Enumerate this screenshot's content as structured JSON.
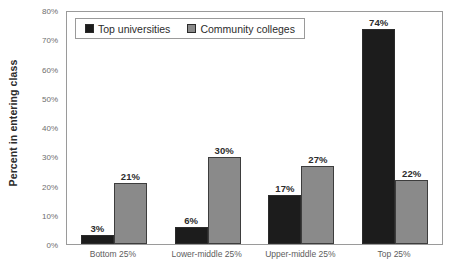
{
  "chart_data": {
    "type": "bar",
    "title": "",
    "xlabel": "",
    "ylabel": "Percent in entering class",
    "categories": [
      "Bottom 25%",
      "Lower-middle 25%",
      "Upper-middle 25%",
      "Top 25%"
    ],
    "series": [
      {
        "name": "Top universities",
        "color": "#1c1c1c",
        "values": [
          3,
          6,
          17,
          74
        ],
        "labels": [
          "3%",
          "6%",
          "17%",
          "74%"
        ]
      },
      {
        "name": "Community colleges",
        "color": "#8a8a8a",
        "values": [
          21,
          30,
          27,
          22
        ],
        "labels": [
          "21%",
          "30%",
          "27%",
          "22%"
        ]
      }
    ],
    "ylim": [
      0,
      80
    ],
    "ytick_values": [
      0,
      10,
      20,
      30,
      40,
      50,
      60,
      70,
      80
    ],
    "ytick_labels": [
      "0%",
      "10%",
      "20%",
      "30%",
      "40%",
      "50%",
      "60%",
      "70%",
      "80%"
    ],
    "grid": false,
    "legend_position": "top-left-inside",
    "value_labels_shown": true
  },
  "axes": {
    "y_title": "Percent in entering class"
  },
  "legend": {
    "items": [
      {
        "label": "Top universities",
        "swatch": "black-square-swatch"
      },
      {
        "label": "Community colleges",
        "swatch": "gray-square-swatch"
      }
    ]
  },
  "colors": {
    "series_top_universities": "#1c1c1c",
    "series_community_colleges": "#8a8a8a",
    "axis_border": "#9a9a9a",
    "tick_text": "#6e6e6e",
    "label_text": "#2c2c2c",
    "background": "#ffffff"
  }
}
